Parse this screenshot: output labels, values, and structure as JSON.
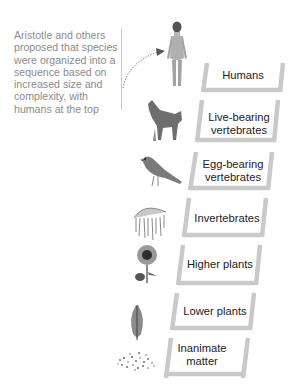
{
  "caption": "Aristotle and others proposed that species were organized into a sequence based on increased size and complexity, with humans at the top",
  "ladder": {
    "rail_color": "#c9c9c9",
    "rungs": [
      {
        "label": "Humans",
        "figure": "human-figure-icon"
      },
      {
        "label": "Live-bearing vertebrates",
        "figure": "wolf-icon"
      },
      {
        "label": "Egg-bearing vertebrates",
        "figure": "bird-icon"
      },
      {
        "label": "Invertebrates",
        "figure": "jellyfish-icon"
      },
      {
        "label": "Higher plants",
        "figure": "sunflower-icon"
      },
      {
        "label": "Lower plants",
        "figure": "fern-leaf-icon"
      },
      {
        "label": "Inanimate matter",
        "figure": "mineral-grains-icon"
      }
    ]
  }
}
